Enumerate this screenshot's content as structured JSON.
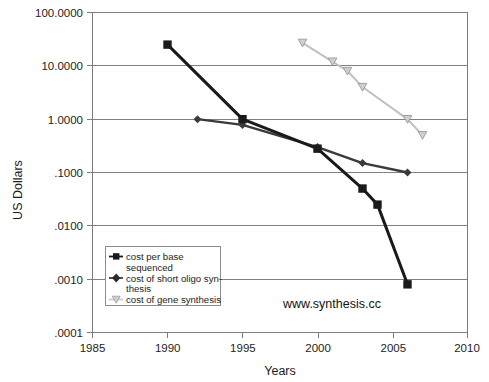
{
  "chart_data": {
    "type": "line",
    "title": "",
    "xlabel": "Years",
    "ylabel": "US Dollars",
    "xlim": [
      1985,
      2010
    ],
    "ylim": [
      0.0001,
      100
    ],
    "yscale": "log",
    "grid": true,
    "legend_position": "inside-lower-left",
    "annotations": [
      "www.synthesis.cc"
    ],
    "xticks": [
      1985,
      1990,
      1995,
      2000,
      2005,
      2010
    ],
    "xticklabels": [
      "1985",
      "1990",
      "1995",
      "2000",
      "2005",
      "2010"
    ],
    "yticks": [
      100,
      10,
      1,
      0.1,
      0.01,
      0.001,
      0.0001
    ],
    "yticklabels": [
      "100.0000",
      "10.0000",
      "1.0000",
      ".1000",
      ".0100",
      ".0010",
      ".0001"
    ],
    "series": [
      {
        "name": "cost per base sequenced",
        "marker": "square",
        "color": "#1a1a1a",
        "x": [
          1990,
          1995,
          2000,
          2003,
          2004,
          2006
        ],
        "values": [
          25,
          1.0,
          0.28,
          0.05,
          0.025,
          0.0008
        ]
      },
      {
        "name": "cost of short oligo synthesis",
        "marker": "diamond",
        "color": "#3a3a3a",
        "x": [
          1992,
          1995,
          2000,
          2003,
          2006
        ],
        "values": [
          1.0,
          0.78,
          0.3,
          0.15,
          0.1
        ]
      },
      {
        "name": "cost of gene synthesis",
        "marker": "triangle-down",
        "color": "#c0c0c0",
        "x": [
          1999,
          2001,
          2002,
          2003,
          2006,
          2007
        ],
        "values": [
          27,
          12,
          8,
          4,
          1.0,
          0.5
        ]
      }
    ]
  },
  "axes": {
    "y_title": "US Dollars",
    "x_title": "Years",
    "y_labels": [
      "100.0000",
      "10.0000",
      "1.0000",
      ".1000",
      ".0100",
      ".0010",
      ".0001"
    ],
    "x_labels": [
      "1985",
      "1990",
      "1995",
      "2000",
      "2005",
      "2010"
    ]
  },
  "legend": {
    "entries": [
      {
        "label_line1": "cost per base",
        "label_line2": "sequenced",
        "marker": "square-marker"
      },
      {
        "label_line1": "cost of short oligo syn-",
        "label_line2": "thesis",
        "marker": "diamond-marker"
      },
      {
        "label_line1": "cost of gene synthesis",
        "label_line2": "",
        "marker": "triangle-down-marker"
      }
    ]
  },
  "watermark": {
    "text": "www.synthesis.cc"
  },
  "colors": {
    "series_sequencing": "#1a1a1a",
    "series_oligo": "#3a3a3a",
    "series_gene": "#c0c0c0",
    "grid": "#808080",
    "axis": "#7a7a7a",
    "background": "#ffffff"
  }
}
